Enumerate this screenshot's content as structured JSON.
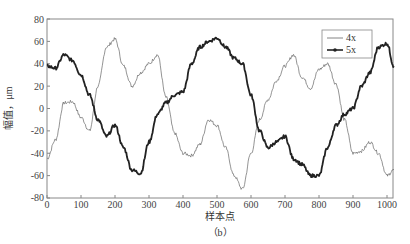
{
  "chart_data": {
    "type": "line",
    "title": "",
    "caption": "（b）",
    "xlabel": "样本点",
    "ylabel": "幅值，μm",
    "xlim": [
      0,
      1020
    ],
    "ylim": [
      -80,
      80
    ],
    "xticks": [
      0,
      100,
      200,
      300,
      400,
      500,
      600,
      700,
      800,
      900,
      1000
    ],
    "yticks": [
      -80,
      -60,
      -40,
      -20,
      0,
      20,
      40,
      60,
      80
    ],
    "grid": false,
    "legend_position": "upper right",
    "x": [
      0,
      25,
      50,
      75,
      100,
      125,
      150,
      175,
      200,
      225,
      250,
      275,
      300,
      325,
      350,
      375,
      400,
      425,
      450,
      475,
      500,
      525,
      550,
      575,
      600,
      625,
      650,
      675,
      700,
      725,
      750,
      775,
      800,
      825,
      850,
      875,
      900,
      925,
      950,
      975,
      1000,
      1020
    ],
    "series": [
      {
        "name": "4x",
        "style": "thin line",
        "color": "#666666",
        "values": [
          -45,
          -28,
          5,
          6,
          -8,
          -20,
          20,
          55,
          62,
          38,
          20,
          32,
          40,
          48,
          10,
          -22,
          -40,
          -42,
          -32,
          -10,
          -15,
          -35,
          -60,
          -72,
          -40,
          -10,
          8,
          25,
          38,
          48,
          28,
          18,
          35,
          40,
          22,
          -10,
          -40,
          -38,
          -30,
          -40,
          -60,
          -55
        ]
      },
      {
        "name": "5x",
        "style": "thick line with dot markers",
        "color": "#222222",
        "values": [
          38,
          36,
          48,
          43,
          30,
          12,
          -10,
          -25,
          -15,
          -35,
          -55,
          -58,
          -30,
          -5,
          5,
          12,
          15,
          40,
          55,
          60,
          63,
          55,
          45,
          40,
          12,
          -20,
          -35,
          -30,
          -25,
          -45,
          -50,
          -60,
          -60,
          -35,
          -15,
          -5,
          0,
          20,
          32,
          55,
          58,
          38
        ]
      }
    ]
  },
  "axes": {
    "ylabel": "幅值，μm",
    "xlabel": "样本点",
    "caption": "（b）"
  },
  "legend": {
    "items": [
      "4x",
      "5x"
    ]
  }
}
